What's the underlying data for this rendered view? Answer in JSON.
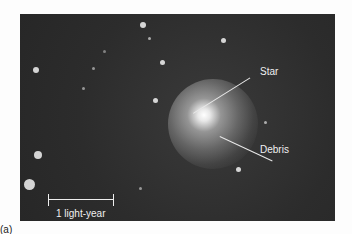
{
  "figure": {
    "labels": {
      "star": "Star",
      "debris": "Debris",
      "scale": "1 light-year"
    },
    "caption": "(a)"
  }
}
